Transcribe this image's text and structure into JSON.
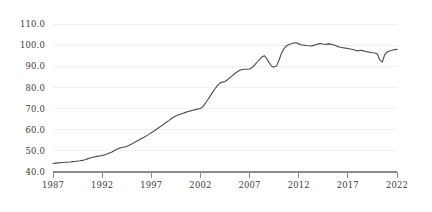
{
  "chart_data": {
    "type": "line",
    "title": "",
    "subtitle": "",
    "xlabel": "",
    "ylabel": "",
    "xlim": [
      1987,
      2022
    ],
    "ylim": [
      40.0,
      110.0
    ],
    "grid": true,
    "legend": null,
    "y_ticks": [
      "40.0",
      "50.0",
      "60.0",
      "70.0",
      "80.0",
      "90.0",
      "100.0",
      "110.0"
    ],
    "y_tick_values": [
      40.0,
      50.0,
      60.0,
      70.0,
      80.0,
      90.0,
      100.0,
      110.0
    ],
    "x_ticks": [
      "1987",
      "1992",
      "1997",
      "2002",
      "2007",
      "2012",
      "2017",
      "2022"
    ],
    "x_tick_values": [
      1987,
      1992,
      1997,
      2002,
      2007,
      2012,
      2017,
      2022
    ],
    "line_color": "#4a4a4a",
    "grid_color": "#f0f0f0",
    "axis_color": "#8a8a8a",
    "series": [
      {
        "name": "index",
        "x": [
          1987.0,
          1987.25,
          1987.5,
          1987.75,
          1988.0,
          1988.25,
          1988.5,
          1988.75,
          1989.0,
          1989.25,
          1989.5,
          1989.75,
          1990.0,
          1990.25,
          1990.5,
          1990.75,
          1991.0,
          1991.25,
          1991.5,
          1991.75,
          1992.0,
          1992.25,
          1992.5,
          1992.75,
          1993.0,
          1993.25,
          1993.5,
          1993.75,
          1994.0,
          1994.25,
          1994.5,
          1994.75,
          1995.0,
          1995.25,
          1995.5,
          1995.75,
          1996.0,
          1996.25,
          1996.5,
          1996.75,
          1997.0,
          1997.25,
          1997.5,
          1997.75,
          1998.0,
          1998.25,
          1998.5,
          1998.75,
          1999.0,
          1999.25,
          1999.5,
          1999.75,
          2000.0,
          2000.25,
          2000.5,
          2000.75,
          2001.0,
          2001.25,
          2001.5,
          2001.75,
          2002.0,
          2002.25,
          2002.5,
          2002.75,
          2003.0,
          2003.25,
          2003.5,
          2003.75,
          2004.0,
          2004.25,
          2004.5,
          2004.75,
          2005.0,
          2005.25,
          2005.5,
          2005.75,
          2006.0,
          2006.25,
          2006.5,
          2006.75,
          2007.0,
          2007.25,
          2007.5,
          2007.75,
          2008.0,
          2008.25,
          2008.5,
          2008.75,
          2009.0,
          2009.25,
          2009.5,
          2009.75,
          2010.0,
          2010.25,
          2010.5,
          2010.75,
          2011.0,
          2011.25,
          2011.5,
          2011.75,
          2012.0,
          2012.25,
          2012.5,
          2012.75,
          2013.0,
          2013.25,
          2013.5,
          2013.75,
          2014.0,
          2014.25,
          2014.5,
          2014.75,
          2015.0,
          2015.25,
          2015.5,
          2015.75,
          2016.0,
          2016.25,
          2016.5,
          2016.75,
          2017.0,
          2017.25,
          2017.5,
          2017.75,
          2018.0,
          2018.25,
          2018.5,
          2018.75,
          2019.0,
          2019.25,
          2019.5,
          2019.75,
          2020.0,
          2020.25,
          2020.5,
          2020.75,
          2021.0,
          2021.25,
          2021.5,
          2021.75,
          2022.0
        ],
        "values": [
          44.0,
          44.2,
          44.3,
          44.4,
          44.5,
          44.6,
          44.6,
          44.7,
          44.9,
          45.0,
          45.2,
          45.3,
          45.5,
          45.8,
          46.2,
          46.6,
          46.9,
          47.2,
          47.4,
          47.6,
          47.8,
          48.1,
          48.5,
          49.0,
          49.5,
          50.2,
          50.8,
          51.3,
          51.6,
          51.8,
          52.1,
          52.6,
          53.2,
          53.9,
          54.5,
          55.1,
          55.8,
          56.4,
          57.1,
          57.8,
          58.6,
          59.3,
          60.1,
          60.9,
          61.7,
          62.5,
          63.4,
          64.2,
          65.1,
          65.9,
          66.5,
          67.0,
          67.4,
          67.8,
          68.2,
          68.6,
          68.9,
          69.2,
          69.5,
          69.8,
          70.0,
          71.0,
          72.5,
          74.2,
          76.0,
          77.8,
          79.5,
          81.0,
          82.2,
          82.5,
          82.8,
          83.6,
          84.6,
          85.6,
          86.6,
          87.4,
          88.1,
          88.5,
          88.6,
          88.6,
          88.7,
          89.4,
          90.5,
          91.8,
          93.2,
          94.4,
          95.0,
          93.6,
          91.6,
          90.0,
          89.6,
          90.2,
          93.0,
          96.2,
          98.4,
          99.6,
          100.3,
          100.7,
          101.0,
          101.1,
          100.6,
          100.2,
          100.0,
          99.8,
          99.7,
          99.6,
          99.9,
          100.2,
          100.6,
          100.8,
          100.5,
          100.4,
          100.6,
          100.5,
          100.2,
          99.8,
          99.3,
          99.0,
          98.8,
          98.6,
          98.4,
          98.2,
          97.9,
          97.6,
          97.3,
          97.6,
          97.4,
          97.1,
          96.8,
          96.6,
          96.4,
          96.3,
          95.8,
          93.0,
          92.0,
          95.5,
          96.8,
          97.2,
          97.6,
          97.9,
          98.0
        ]
      }
    ]
  }
}
